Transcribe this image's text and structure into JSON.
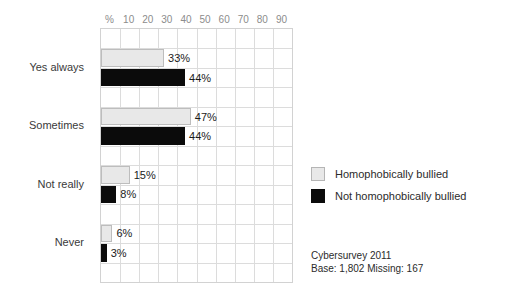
{
  "chart_data": {
    "type": "bar",
    "orientation": "horizontal",
    "title": "",
    "xlabel": "%",
    "ylabel": "",
    "xlim": [
      0,
      100
    ],
    "xticks": [
      10,
      20,
      30,
      40,
      50,
      60,
      70,
      80,
      90
    ],
    "xtick_labels": [
      "10",
      "20",
      "30",
      "40",
      "50",
      "60",
      "70",
      "80",
      "90"
    ],
    "grid": true,
    "legend_position": "right",
    "categories": [
      "Yes always",
      "Sometimes",
      "Not really",
      "Never"
    ],
    "series": [
      {
        "name": "Homophobically bullied",
        "color": "#e8e8e8",
        "values": [
          33,
          47,
          15,
          6
        ],
        "labels": [
          "33%",
          "47%",
          "15%",
          "6%"
        ]
      },
      {
        "name": "Not homophobically bullied",
        "color": "#0b0b0b",
        "values": [
          44,
          44,
          8,
          3
        ],
        "labels": [
          "44%",
          "44%",
          "8%",
          "3%"
        ]
      }
    ]
  },
  "axis": {
    "percent_symbol": "%"
  },
  "legend": {
    "items": [
      {
        "label": "Homophobically bullied",
        "swatch": "light"
      },
      {
        "label": "Not homophobically bullied",
        "swatch": "dark"
      }
    ]
  },
  "source_note": {
    "line1": "Cybersurvey 2011",
    "line2": "Base: 1,802  Missing: 167"
  }
}
